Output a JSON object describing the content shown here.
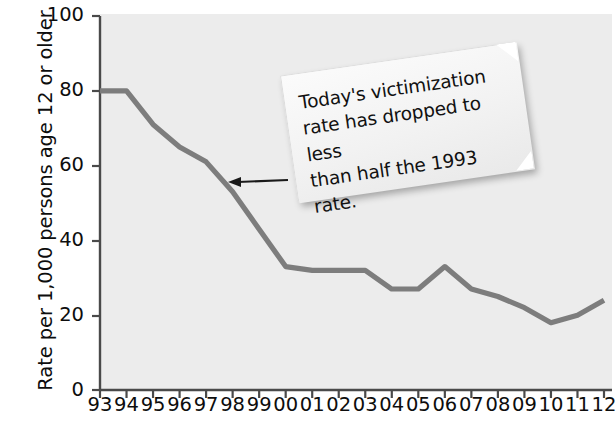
{
  "chart_data": {
    "type": "line",
    "title": "",
    "xlabel": "",
    "ylabel": "Rate per 1,000 persons age 12 or older",
    "categories": [
      "93",
      "94",
      "95",
      "96",
      "97",
      "98",
      "99",
      "00",
      "01",
      "02",
      "03",
      "04",
      "05",
      "06",
      "07",
      "08",
      "09",
      "10",
      "11",
      "12"
    ],
    "values": [
      80,
      80,
      71,
      65,
      61,
      53,
      43,
      33,
      32,
      32,
      32,
      27,
      27,
      33,
      27,
      25,
      22,
      18,
      20,
      24
    ],
    "series": [
      {
        "name": "Violent victimization rate",
        "values": [
          80,
          80,
          71,
          65,
          61,
          53,
          43,
          33,
          32,
          32,
          32,
          27,
          27,
          33,
          27,
          25,
          22,
          18,
          20,
          24
        ]
      }
    ],
    "xlim": [
      0,
      19
    ],
    "ylim": [
      0,
      100
    ],
    "y_ticks": [
      0,
      20,
      40,
      60,
      80,
      100
    ],
    "grid": false,
    "legend": "none",
    "line_color": "#7d7d7d",
    "plot_bg_color": "#ececec",
    "text_color": "#0d0d0d",
    "annotations": [
      {
        "id": "callout-note",
        "text": "Today's victimization rate has dropped to less than half the 1993 rate.",
        "points_to_year": "98",
        "points_to_value": 53
      }
    ]
  },
  "y_axis": {
    "title": "Rate per 1,000 persons age 12 or older",
    "ticks": [
      "100",
      "80",
      "60",
      "40",
      "20",
      "0"
    ]
  },
  "x_axis": {
    "ticks": [
      "93",
      "94",
      "95",
      "96",
      "97",
      "98",
      "99",
      "00",
      "01",
      "02",
      "03",
      "04",
      "05",
      "06",
      "07",
      "08",
      "09",
      "10",
      "11",
      "12"
    ]
  },
  "callout": {
    "line1": "Today's victimization",
    "line2": "rate has dropped to less",
    "line3": "than half the 1993 rate."
  }
}
